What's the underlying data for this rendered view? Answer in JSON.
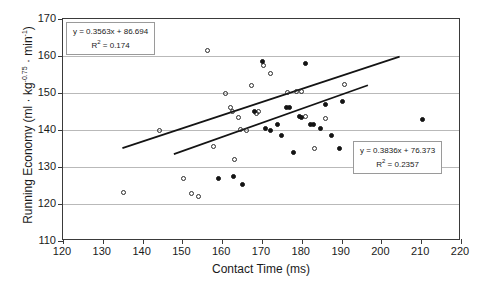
{
  "chart_data": {
    "type": "scatter",
    "title": "",
    "xlabel": "Contact Time (ms)",
    "ylabel": "Running Economy (ml · kg-0.75 · min-1)",
    "ylabel_parts": {
      "lead": "Running Economy (ml · kg",
      "exp1": "-0.75",
      "mid": " · min",
      "exp2": "-1",
      "tail": ")"
    },
    "xlim": [
      120,
      220
    ],
    "ylim": [
      110,
      170
    ],
    "xticks": [
      120,
      130,
      140,
      150,
      160,
      170,
      180,
      190,
      200,
      210,
      220
    ],
    "yticks": [
      110,
      120,
      130,
      140,
      150,
      160,
      170
    ],
    "grid": "horizontal",
    "legend": "none",
    "series": [
      {
        "name": "open-circles",
        "marker": "open-circle",
        "color": "#2b2b2b",
        "points": [
          [
            135.3,
            123.0
          ],
          [
            144.2,
            139.8
          ],
          [
            150.4,
            126.8
          ],
          [
            152.3,
            122.8
          ],
          [
            154.0,
            122.0
          ],
          [
            156.2,
            161.5
          ],
          [
            157.8,
            135.6
          ],
          [
            160.8,
            149.9
          ],
          [
            162.2,
            146.1
          ],
          [
            162.7,
            144.9
          ],
          [
            163.0,
            132.0
          ],
          [
            164.0,
            143.3
          ],
          [
            164.6,
            140.1
          ],
          [
            166.0,
            139.8
          ],
          [
            167.4,
            152.0
          ],
          [
            168.5,
            144.4
          ],
          [
            169.0,
            145.1
          ],
          [
            170.4,
            157.4
          ],
          [
            172.2,
            155.2
          ],
          [
            176.4,
            150.2
          ],
          [
            178.6,
            150.4
          ],
          [
            180.0,
            150.3
          ],
          [
            181.0,
            143.6
          ],
          [
            183.2,
            135.0
          ],
          [
            186.0,
            143.2
          ],
          [
            190.8,
            152.4
          ]
        ]
      },
      {
        "name": "filled-circles",
        "marker": "filled-circle",
        "color": "#141414",
        "points": [
          [
            159.0,
            127.0
          ],
          [
            162.8,
            127.4
          ],
          [
            165.2,
            125.2
          ],
          [
            168.0,
            145.0
          ],
          [
            170.0,
            158.6
          ],
          [
            170.8,
            140.3
          ],
          [
            172.2,
            140.0
          ],
          [
            174.0,
            141.6
          ],
          [
            175.0,
            138.6
          ],
          [
            176.2,
            146.0
          ],
          [
            177.0,
            146.2
          ],
          [
            178.0,
            133.8
          ],
          [
            179.4,
            143.6
          ],
          [
            180.0,
            143.4
          ],
          [
            181.0,
            158.0
          ],
          [
            182.2,
            141.5
          ],
          [
            183.0,
            141.6
          ],
          [
            184.6,
            140.5
          ],
          [
            186.0,
            146.9
          ],
          [
            187.4,
            138.6
          ],
          [
            189.4,
            135.0
          ],
          [
            190.2,
            147.8
          ],
          [
            210.4,
            142.9
          ]
        ]
      }
    ],
    "trendlines": [
      {
        "name": "upper-trendline",
        "equation": "y = 0.3563x + 86.694",
        "slope": 0.3563,
        "intercept": 86.694,
        "r2_label": "R2 = 0.174",
        "r2_value": 0.174,
        "r2_prefix": "R",
        "r2_exp": "2",
        "r2_suffix": " = 0.174",
        "x_start": 135,
        "x_end": 205
      },
      {
        "name": "lower-trendline",
        "equation": "y = 0.3836x + 76.373",
        "slope": 0.3836,
        "intercept": 76.373,
        "r2_label": "R2 = 0.2357",
        "r2_value": 0.2357,
        "r2_prefix": "R",
        "r2_exp": "2",
        "r2_suffix": " = 0.2357",
        "x_start": 148,
        "x_end": 197
      }
    ]
  }
}
